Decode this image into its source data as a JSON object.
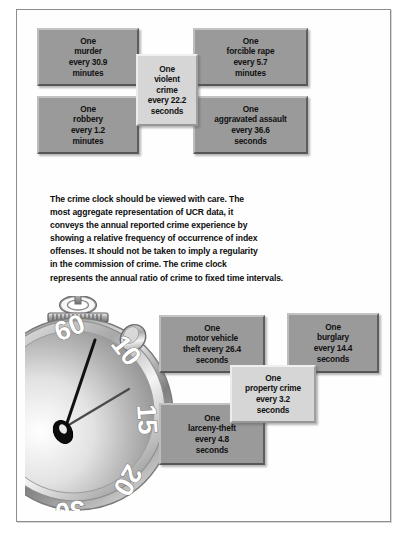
{
  "figure": {
    "title_alt": "Crime Clock",
    "frame_color": "#8d8d8d",
    "box_color": "#9a9a9a",
    "center_box_color": "#d6d6d6"
  },
  "violent_section": {
    "boxes": [
      {
        "id": "murder",
        "lines": [
          "One",
          "murder",
          "every 30.9",
          "minutes"
        ]
      },
      {
        "id": "forcible-rape",
        "lines": [
          "One",
          "forcible rape",
          "every 5.7",
          "minutes"
        ]
      },
      {
        "id": "robbery",
        "lines": [
          "One",
          "robbery",
          "every 1.2",
          "minutes"
        ]
      },
      {
        "id": "aggravated-assault",
        "lines": [
          "One",
          "aggravated assault",
          "every 36.6",
          "seconds"
        ]
      }
    ],
    "center": {
      "id": "violent-crime",
      "lines": [
        "One",
        "violent",
        "crime",
        "every 22.2",
        "seconds"
      ]
    }
  },
  "note": {
    "lines": [
      "The crime clock should be viewed with care. The",
      "most aggregate representation of UCR data, it",
      "conveys the annual reported crime experience by",
      "showing a relative frequency of occurrence of index",
      "offenses. It should not be taken to imply a regularity",
      "in the commission of crime. The crime clock",
      "represents the annual ratio of crime to fixed time intervals."
    ]
  },
  "property_section": {
    "boxes": [
      {
        "id": "motor-vehicle-theft",
        "lines": [
          "One",
          "motor vehicle",
          "theft every 26.4",
          "seconds"
        ]
      },
      {
        "id": "burglary",
        "lines": [
          "One",
          "burglary",
          "every 14.4",
          "seconds"
        ]
      },
      {
        "id": "larceny-theft",
        "lines": [
          "One",
          "larceny-theft",
          "every 4.8",
          "seconds"
        ]
      }
    ],
    "center": {
      "id": "property-crime",
      "lines": [
        "One",
        "property crime",
        "every 3.2",
        "seconds"
      ]
    }
  },
  "stopwatch": {
    "dial_numbers": [
      "60",
      "10",
      "15",
      "20",
      "30"
    ],
    "hands": 2
  }
}
